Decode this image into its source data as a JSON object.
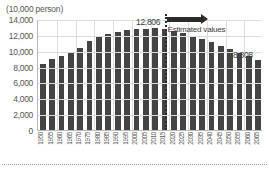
{
  "chart_data": {
    "type": "bar",
    "title": "",
    "unit_label": "(10,000 person)",
    "xlabel": "",
    "ylabel": "",
    "ylim": [
      0,
      14000
    ],
    "ytick_values": [
      0,
      2000,
      4000,
      6000,
      8000,
      10000,
      12000,
      14000
    ],
    "ytick_labels": [
      "0",
      "2,000",
      "4,000",
      "6,000",
      "8,000",
      "10,000",
      "12,000",
      "14,000"
    ],
    "grid": true,
    "legend_position": "none",
    "categories": [
      "1950",
      "1955",
      "1960",
      "1965",
      "1970",
      "1975",
      "1980",
      "1985",
      "1990",
      "1995",
      "2000",
      "2005",
      "2010",
      "2015",
      "2020",
      "2025",
      "2030",
      "2035",
      "2040",
      "2045",
      "2050",
      "2055",
      "2060",
      "2065"
    ],
    "values": [
      8320,
      8928,
      9342,
      9828,
      10372,
      11194,
      11706,
      12105,
      12361,
      12557,
      12693,
      12777,
      12806,
      12709,
      12532,
      12254,
      11913,
      11522,
      11092,
      10642,
      10192,
      9744,
      9284,
      8808
    ],
    "annotations": [
      {
        "name": "peak-value",
        "text": "12,806",
        "category": "2010"
      },
      {
        "name": "end-value",
        "text": "8,808",
        "category": "2065"
      },
      {
        "name": "estimate-divider",
        "text": "",
        "category": "2015"
      },
      {
        "name": "estimated-values-label",
        "text": "Estimated values",
        "category": "2025"
      }
    ],
    "bar_color": "#444444",
    "divider_color": "#2b2b2b",
    "grid_color": "#dcdcdc",
    "axis_color": "#b9b9b9"
  },
  "labels": {
    "unit": "(10,000 person)",
    "estimated": "Estimated values",
    "peak": "12,806",
    "final": "8,808"
  }
}
